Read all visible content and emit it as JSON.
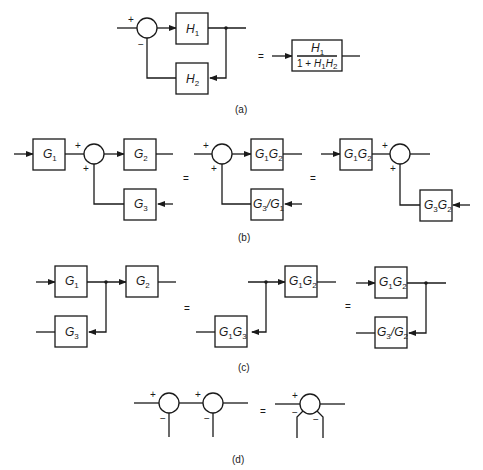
{
  "panels": {
    "a": {
      "caption": "(a)",
      "left": {
        "forward_block": "H1",
        "feedback_block": "H2",
        "signs": [
          "+",
          "−"
        ]
      },
      "equals": "=",
      "right": {
        "numerator": "H1",
        "denominator": "1 + H1H2"
      }
    },
    "b": {
      "caption": "(b)",
      "diagram1": {
        "blocks": [
          "G1",
          "G2",
          "G3"
        ],
        "signs": [
          "+",
          "+"
        ]
      },
      "equals1": "=",
      "diagram2": {
        "blocks": [
          "G1G2",
          "G3/G1"
        ],
        "signs": [
          "+",
          "+"
        ]
      },
      "equals2": "=",
      "diagram3": {
        "blocks": [
          "G1G2",
          "G3G2"
        ],
        "signs": [
          "+",
          "+"
        ]
      }
    },
    "c": {
      "caption": "(c)",
      "diagram1": {
        "blocks": [
          "G1",
          "G2",
          "G3"
        ]
      },
      "equals1": "=",
      "diagram2": {
        "blocks": [
          "G1G2",
          "G1G3"
        ]
      },
      "equals2": "=",
      "diagram3": {
        "blocks": [
          "G1G2",
          "G3/G2"
        ]
      }
    },
    "d": {
      "caption": "(d)",
      "left": {
        "junctions": 2,
        "signs": [
          "+",
          "−",
          "+",
          "−"
        ]
      },
      "equals": "=",
      "right": {
        "junctions": 1,
        "signs": [
          "+",
          "−",
          "−"
        ]
      }
    }
  },
  "labels": {
    "H1": [
      "H",
      "1"
    ],
    "H2": [
      "H",
      "2"
    ],
    "G1": [
      "G",
      "1"
    ],
    "G2": [
      "G",
      "2"
    ],
    "G3": [
      "G",
      "3"
    ]
  }
}
